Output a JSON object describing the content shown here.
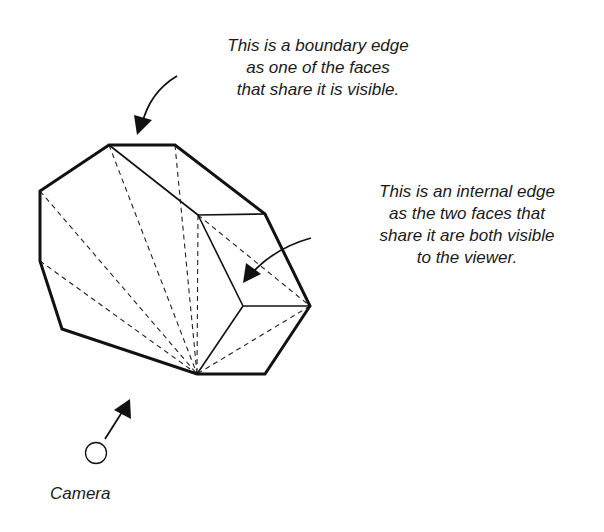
{
  "annotations": {
    "boundary_edge": {
      "lines": [
        "This is a boundary edge",
        "as one of the faces",
        "that share it is visible."
      ]
    },
    "internal_edge": {
      "lines": [
        "This is an internal edge",
        "as the two faces that",
        "share it are both visible",
        "to the viewer."
      ]
    },
    "camera": {
      "label": "Camera"
    }
  },
  "geometry": {
    "boundary_outline": [
      [
        109,
        145
      ],
      [
        175,
        145
      ],
      [
        265,
        214
      ],
      [
        310,
        306
      ],
      [
        265,
        374
      ],
      [
        197,
        374
      ],
      [
        62,
        329
      ],
      [
        40,
        261
      ],
      [
        40,
        191
      ]
    ],
    "solid_internal_edges": [
      [
        [
          109,
          145
        ],
        [
          198,
          215
        ]
      ],
      [
        [
          198,
          215
        ],
        [
          265,
          214
        ]
      ],
      [
        [
          198,
          215
        ],
        [
          243,
          306
        ]
      ],
      [
        [
          243,
          306
        ],
        [
          310,
          306
        ]
      ],
      [
        [
          243,
          306
        ],
        [
          197,
          374
        ]
      ]
    ],
    "dashed_hidden_edges": [
      [
        [
          40,
          191
        ],
        [
          197,
          374
        ]
      ],
      [
        [
          40,
          261
        ],
        [
          197,
          374
        ]
      ],
      [
        [
          109,
          145
        ],
        [
          197,
          374
        ]
      ],
      [
        [
          175,
          145
        ],
        [
          197,
          374
        ]
      ],
      [
        [
          198,
          215
        ],
        [
          197,
          374
        ]
      ],
      [
        [
          198,
          215
        ],
        [
          310,
          306
        ]
      ],
      [
        [
          310,
          306
        ],
        [
          197,
          374
        ]
      ]
    ],
    "camera_circle": {
      "cx": 96,
      "cy": 453,
      "r": 11
    },
    "colors": {
      "stroke": "#111111",
      "background": "#ffffff"
    }
  }
}
